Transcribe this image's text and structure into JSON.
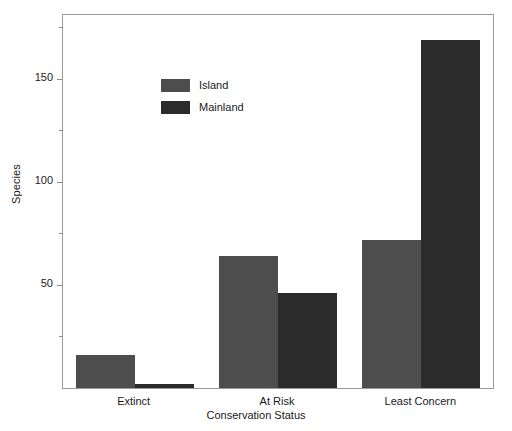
{
  "chart_data": {
    "type": "bar",
    "title": "",
    "subtitle": "",
    "xlabel": "Conservation Status",
    "ylabel": "Species",
    "categories": [
      "Extinct",
      "At Risk",
      "Least Concern"
    ],
    "series": [
      {
        "name": "Island",
        "color": "#4d4d4d",
        "values": [
          16,
          64,
          72
        ]
      },
      {
        "name": "Mainland",
        "color": "#2b2b2b",
        "values": [
          2,
          46,
          169
        ]
      }
    ],
    "ylim": [
      0,
      181
    ],
    "yticks": [
      50,
      100,
      150
    ],
    "ytick_labels": [
      "50",
      "100",
      "150"
    ],
    "yminor_ticks": [
      25,
      75,
      125,
      175
    ],
    "grid": false,
    "legend_position": "upper left",
    "legend_entries": [
      "Island",
      "Mainland"
    ],
    "axis_color": "#9a9a9a",
    "background": "#ffffff"
  }
}
